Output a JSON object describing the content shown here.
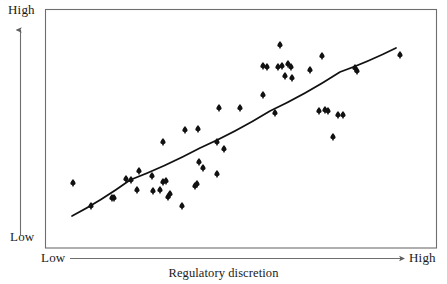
{
  "chart_data": {
    "type": "scatter",
    "title": "",
    "xlabel": "Regulatory discretion",
    "ylabel": "",
    "xlim": [
      0,
      100
    ],
    "ylim": [
      0,
      100
    ],
    "grid": false,
    "legend": false,
    "x_tick_labels": [
      "Low",
      "High"
    ],
    "y_tick_labels": [
      "Low",
      "High"
    ],
    "annotations": [
      {
        "name": "correlation",
        "symbol": "r",
        "text": " = 0.76",
        "value": 0.76
      }
    ],
    "trendline": {
      "name": "fitted-curve",
      "shape": "concave-down",
      "points_px": [
        [
          72,
          216
        ],
        [
          130,
          180
        ],
        [
          200,
          148
        ],
        [
          270,
          111
        ],
        [
          340,
          72
        ],
        [
          396,
          48
        ]
      ]
    },
    "points_px": [
      [
        73,
        183
      ],
      [
        91,
        206
      ],
      [
        112,
        198
      ],
      [
        114,
        198
      ],
      [
        126,
        179
      ],
      [
        131,
        180
      ],
      [
        137,
        190
      ],
      [
        139,
        171
      ],
      [
        152,
        176
      ],
      [
        153,
        191
      ],
      [
        160,
        190
      ],
      [
        163,
        142
      ],
      [
        163,
        182
      ],
      [
        166,
        181
      ],
      [
        168,
        197
      ],
      [
        170,
        194
      ],
      [
        182,
        206
      ],
      [
        185,
        130
      ],
      [
        195,
        186
      ],
      [
        197,
        184
      ],
      [
        198,
        129
      ],
      [
        199,
        162
      ],
      [
        203,
        168
      ],
      [
        217,
        142
      ],
      [
        217,
        174
      ],
      [
        219,
        108
      ],
      [
        224,
        149
      ],
      [
        240,
        108
      ],
      [
        263,
        66
      ],
      [
        263,
        95
      ],
      [
        267,
        67
      ],
      [
        275,
        113
      ],
      [
        278,
        67
      ],
      [
        280,
        45
      ],
      [
        282,
        66
      ],
      [
        285,
        76
      ],
      [
        288,
        64
      ],
      [
        291,
        67
      ],
      [
        292,
        78
      ],
      [
        310,
        70
      ],
      [
        319,
        111
      ],
      [
        322,
        56
      ],
      [
        325,
        110
      ],
      [
        328,
        111
      ],
      [
        333,
        137
      ],
      [
        338,
        115
      ],
      [
        343,
        115
      ],
      [
        355,
        68
      ],
      [
        357,
        71
      ],
      [
        400,
        55
      ]
    ],
    "marker": {
      "shape": "diamond-spade",
      "color": "#111111",
      "size_px": 7
    },
    "n_points": 50
  },
  "axes": {
    "y": {
      "high_label": "High",
      "low_label": "Low",
      "arrow": "up-arrow-icon"
    },
    "x": {
      "low_label": "Low",
      "high_label": "High",
      "arrow": "right-arrow-icon",
      "title": "Regulatory discretion"
    }
  },
  "annotation": {
    "r_symbol": "r",
    "r_value": " = 0.76"
  },
  "style": {
    "frame_color": "#6e6e6e",
    "axis_color": "#6e6e6e",
    "point_color": "#111111",
    "line_color": "#111111",
    "background": "#ffffff"
  }
}
